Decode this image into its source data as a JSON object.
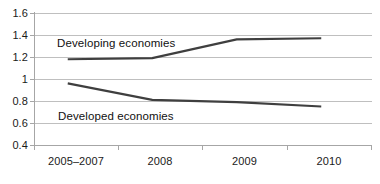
{
  "chart_data": {
    "type": "line",
    "title": "",
    "subtitle": "",
    "xlabel": "",
    "ylabel": "",
    "categories": [
      "2005–2007",
      "2008",
      "2009",
      "2010"
    ],
    "ylim": [
      0.4,
      1.6
    ],
    "yticks": [
      "0.4",
      "0.6",
      "0.8",
      "1",
      "1.2",
      "1.4",
      "1.6"
    ],
    "ytick_values": [
      0.4,
      0.6,
      0.8,
      1.0,
      1.2,
      1.4,
      1.6
    ],
    "grid": true,
    "legend_position": "inline-annotation",
    "series": [
      {
        "name": "Developing economies",
        "values": [
          1.18,
          1.19,
          1.36,
          1.37
        ],
        "color": "#3f3f3f"
      },
      {
        "name": "Developed economies",
        "values": [
          0.96,
          0.81,
          0.79,
          0.75
        ],
        "color": "#3f3f3f"
      }
    ],
    "annotations": [
      {
        "text": "Developing economies",
        "series": "Developing economies"
      },
      {
        "text": "Developed economies",
        "series": "Developed economies"
      }
    ],
    "colors": {
      "gridline": "#bfbfbf",
      "axis": "#a6a6a6",
      "line": "#3f3f3f",
      "text": "#1a1a1a",
      "background": "#ffffff"
    }
  },
  "axis": {
    "y": {
      "t0": "0.4",
      "t1": "0.6",
      "t2": "0.8",
      "t3": "1",
      "t4": "1.2",
      "t5": "1.4",
      "t6": "1.6"
    },
    "x": {
      "t0": "2005–2007",
      "t1": "2008",
      "t2": "2009",
      "t3": "2010"
    }
  },
  "labels": {
    "developing": "Developing economies",
    "developed": "Developed economies"
  }
}
